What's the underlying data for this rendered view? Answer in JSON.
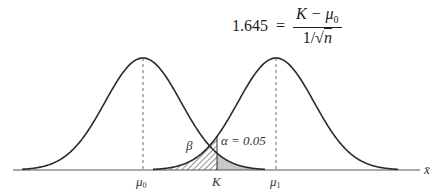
{
  "formula": {
    "lhs": "1.645",
    "equals": "=",
    "numerator": "K − μ",
    "numerator_sub": "0",
    "denominator_prefix": "1/√",
    "denominator_var": "n"
  },
  "diagram": {
    "labels": {
      "mu0": "μ",
      "mu0_sub": "0",
      "mu1": "μ",
      "mu1_sub": "1",
      "K": "K",
      "beta": "β",
      "alpha": "α = 0.05",
      "axis": "x̄"
    },
    "colors": {
      "curve": "#2a2a2a",
      "axis": "#555555",
      "alpha_fill": "#c8c8c8",
      "beta_hatch": "#444444",
      "dashed": "#666666"
    }
  }
}
